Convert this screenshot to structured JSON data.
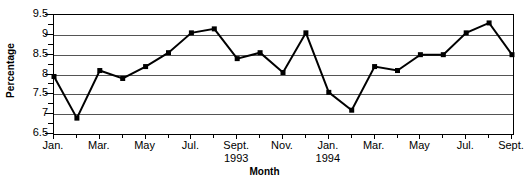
{
  "chart_data": {
    "type": "line",
    "title": "",
    "xlabel": "Month",
    "ylabel": "Percentage",
    "ylim": [
      6.5,
      9.5
    ],
    "ytick_step": 0.5,
    "yminor_step": 0.25,
    "grid": true,
    "legend": null,
    "marker": "square",
    "line_color": "#000000",
    "marker_color": "#000000",
    "grid_color": "#555555",
    "axis_color": "#000000",
    "background": "#ffffff",
    "yticks": [
      9.5,
      9,
      8.5,
      8,
      7.5,
      7,
      6.5
    ],
    "ytick_labels": [
      "9.5",
      "9",
      "8.5",
      "8",
      "7.5",
      "7",
      "6.5"
    ],
    "xticks": [
      {
        "index": 0,
        "label": "Jan.",
        "year": "",
        "major": true
      },
      {
        "index": 1,
        "label": "",
        "year": "",
        "major": false
      },
      {
        "index": 2,
        "label": "Mar.",
        "year": "",
        "major": true
      },
      {
        "index": 3,
        "label": "",
        "year": "",
        "major": false
      },
      {
        "index": 4,
        "label": "May",
        "year": "",
        "major": true
      },
      {
        "index": 5,
        "label": "",
        "year": "",
        "major": false
      },
      {
        "index": 6,
        "label": "Jul.",
        "year": "",
        "major": true
      },
      {
        "index": 7,
        "label": "",
        "year": "",
        "major": false
      },
      {
        "index": 8,
        "label": "Sept.",
        "year": "1993",
        "major": true
      },
      {
        "index": 9,
        "label": "",
        "year": "",
        "major": false
      },
      {
        "index": 10,
        "label": "Nov.",
        "year": "",
        "major": true
      },
      {
        "index": 11,
        "label": "",
        "year": "",
        "major": false
      },
      {
        "index": 12,
        "label": "Jan.",
        "year": "1994",
        "major": true
      },
      {
        "index": 13,
        "label": "",
        "year": "",
        "major": false
      },
      {
        "index": 14,
        "label": "Mar.",
        "year": "",
        "major": true
      },
      {
        "index": 15,
        "label": "",
        "year": "",
        "major": false
      },
      {
        "index": 16,
        "label": "May",
        "year": "",
        "major": true
      },
      {
        "index": 17,
        "label": "",
        "year": "",
        "major": false
      },
      {
        "index": 18,
        "label": "Jul.",
        "year": "",
        "major": true
      },
      {
        "index": 19,
        "label": "",
        "year": "",
        "major": false
      },
      {
        "index": 20,
        "label": "Sept.",
        "year": "",
        "major": true
      }
    ],
    "categories": [
      "Jan. 1993",
      "Feb. 1993",
      "Mar. 1993",
      "Apr. 1993",
      "May 1993",
      "Jun. 1993",
      "Jul. 1993",
      "Aug. 1993",
      "Sept. 1993",
      "Oct. 1993",
      "Nov. 1993",
      "Dec. 1993",
      "Jan. 1994",
      "Feb. 1994",
      "Mar. 1994",
      "Apr. 1994",
      "May 1994",
      "Jun. 1994",
      "Jul. 1994",
      "Aug. 1994",
      "Sept. 1994"
    ],
    "values": [
      7.95,
      6.9,
      8.1,
      7.9,
      8.2,
      8.55,
      9.05,
      9.15,
      8.4,
      8.55,
      8.05,
      9.05,
      7.55,
      7.1,
      8.2,
      8.1,
      8.5,
      8.5,
      9.05,
      9.3,
      8.5
    ]
  }
}
